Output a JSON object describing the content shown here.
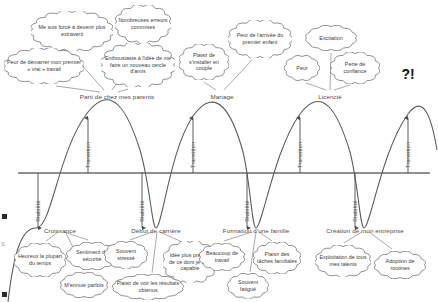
{
  "meta": {
    "background": "#ffffff",
    "curve_color": "#5a5a5a",
    "baseline_color": "#8a8a8a",
    "text_color": "#3d3d3d"
  },
  "axis": {
    "baseline_y_label": "",
    "transition_label": "Transition",
    "stability_label": "Stabilite_accented"
  },
  "labels": {
    "transition": "Transition",
    "stabilite": "Stabilité"
  },
  "end_marker": "?!",
  "milestones": [
    {
      "id": "parents",
      "label": "Parti de chez mes parents",
      "x": 117,
      "y": 93,
      "kind": "peak"
    },
    {
      "id": "mariage",
      "label": "Mariage",
      "x": 222,
      "y": 93,
      "kind": "peak"
    },
    {
      "id": "licencie",
      "label": "Licencié",
      "x": 330,
      "y": 93,
      "kind": "peak"
    },
    {
      "id": "croissance",
      "label": "Croissance",
      "x": 60,
      "y": 227,
      "kind": "trough"
    },
    {
      "id": "carriere",
      "label": "Début de carrière",
      "x": 156,
      "y": 227,
      "kind": "trough"
    },
    {
      "id": "famille",
      "label": "Formation d'une famille",
      "x": 256,
      "y": 227,
      "kind": "trough"
    },
    {
      "id": "entreprise",
      "label": "Création de mon entreprise",
      "x": 365,
      "y": 227,
      "kind": "trough"
    }
  ],
  "transitions": [
    {
      "x": 88,
      "y": 150
    },
    {
      "x": 193,
      "y": 150
    },
    {
      "x": 300,
      "y": 150
    },
    {
      "x": 408,
      "y": 150
    }
  ],
  "stabilities": [
    {
      "x": 38,
      "y": 200
    },
    {
      "x": 142,
      "y": 200
    },
    {
      "x": 247,
      "y": 200
    },
    {
      "x": 355,
      "y": 200
    }
  ],
  "clouds": [
    {
      "id": "extraverti",
      "text": "Me suis forcé à devenir plus extraverti",
      "x": 72,
      "y": 31,
      "w": 82,
      "h": 40
    },
    {
      "id": "erreurs",
      "text": "Nombreuses erreurs commises",
      "x": 143,
      "y": 24,
      "w": 56,
      "h": 38
    },
    {
      "id": "peur-travail",
      "text": "Peur de démarrer mon premier « vrai » travail",
      "x": 44,
      "y": 66,
      "w": 80,
      "h": 36
    },
    {
      "id": "enthousiaste",
      "text": "Enthousiaste à l'idée de me faire un nouveau cercle d'amis",
      "x": 138,
      "y": 65,
      "w": 74,
      "h": 44
    },
    {
      "id": "couple",
      "text": "Plaisir de s'installer en couple",
      "x": 204,
      "y": 62,
      "w": 50,
      "h": 36
    },
    {
      "id": "enfant",
      "text": "Peur de l'arrivée du premier enfant",
      "x": 260,
      "y": 39,
      "w": 64,
      "h": 38
    },
    {
      "id": "excitation",
      "text": "Excitation",
      "x": 331,
      "y": 38,
      "w": 52,
      "h": 26
    },
    {
      "id": "peur",
      "text": "Peur",
      "x": 302,
      "y": 68,
      "w": 36,
      "h": 26
    },
    {
      "id": "perte",
      "text": "Perte de confiance",
      "x": 355,
      "y": 68,
      "w": 50,
      "h": 32
    },
    {
      "id": "heureux",
      "text": "Heureux la plupart du temps",
      "x": 40,
      "y": 260,
      "w": 52,
      "h": 34
    },
    {
      "id": "securite",
      "text": "Sentiment de sécurité",
      "x": 92,
      "y": 256,
      "w": 52,
      "h": 28
    },
    {
      "id": "ennuie",
      "text": "M'ennuie parfois",
      "x": 84,
      "y": 285,
      "w": 48,
      "h": 26
    },
    {
      "id": "stresse",
      "text": "Souvent stressé",
      "x": 126,
      "y": 255,
      "w": 44,
      "h": 28
    },
    {
      "id": "idee",
      "text": "Idée plus précise de ce dont je suis capable",
      "x": 190,
      "y": 262,
      "w": 54,
      "h": 42
    },
    {
      "id": "resultats",
      "text": "Plaisir de voir les résultats obtenus",
      "x": 148,
      "y": 287,
      "w": 72,
      "h": 26
    },
    {
      "id": "beaucoup",
      "text": "Beaucoup de travail",
      "x": 222,
      "y": 257,
      "w": 46,
      "h": 28
    },
    {
      "id": "taches",
      "text": "Plaisir des tâches familiales",
      "x": 277,
      "y": 258,
      "w": 48,
      "h": 32
    },
    {
      "id": "fatigue",
      "text": "Souvent fatigué",
      "x": 248,
      "y": 286,
      "w": 42,
      "h": 26
    },
    {
      "id": "talents",
      "text": "Exploitation de tous mes talents",
      "x": 343,
      "y": 261,
      "w": 56,
      "h": 32
    },
    {
      "id": "routines",
      "text": "Adoption de routines",
      "x": 400,
      "y": 265,
      "w": 52,
      "h": 28
    }
  ],
  "leaders": [
    {
      "from": [
        72,
        54
      ],
      "to": [
        104,
        90
      ]
    },
    {
      "from": [
        143,
        46
      ],
      "to": [
        112,
        90
      ]
    },
    {
      "from": [
        56,
        86
      ],
      "to": [
        100,
        92
      ]
    },
    {
      "from": [
        128,
        89
      ],
      "to": [
        118,
        92
      ]
    },
    {
      "from": [
        204,
        82
      ],
      "to": [
        216,
        90
      ]
    },
    {
      "from": [
        252,
        60
      ],
      "to": [
        224,
        90
      ]
    },
    {
      "from": [
        331,
        53
      ],
      "to": [
        330,
        90
      ]
    },
    {
      "from": [
        306,
        83
      ],
      "to": [
        326,
        90
      ]
    },
    {
      "from": [
        350,
        85
      ],
      "to": [
        334,
        90
      ]
    },
    {
      "from": [
        46,
        241
      ],
      "to": [
        58,
        232
      ]
    },
    {
      "from": [
        88,
        240
      ],
      "to": [
        64,
        232
      ]
    },
    {
      "from": [
        84,
        270
      ],
      "to": [
        66,
        233
      ]
    },
    {
      "from": [
        130,
        240
      ],
      "to": [
        152,
        232
      ]
    },
    {
      "from": [
        182,
        242
      ],
      "to": [
        160,
        232
      ]
    },
    {
      "from": [
        152,
        273
      ],
      "to": [
        157,
        232
      ]
    },
    {
      "from": [
        224,
        241
      ],
      "to": [
        252,
        232
      ]
    },
    {
      "from": [
        272,
        241
      ],
      "to": [
        259,
        232
      ]
    },
    {
      "from": [
        250,
        272
      ],
      "to": [
        256,
        232
      ]
    },
    {
      "from": [
        344,
        243
      ],
      "to": [
        362,
        232
      ]
    },
    {
      "from": [
        392,
        249
      ],
      "to": [
        369,
        232
      ]
    }
  ],
  "edge_marks": [
    {
      "x": 2,
      "y": 214
    },
    {
      "x": 2,
      "y": 292
    }
  ],
  "edge_letter": "S"
}
